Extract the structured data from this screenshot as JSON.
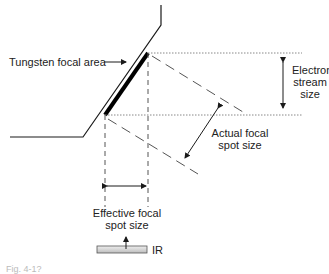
{
  "diagram": {
    "labels": {
      "tungsten_focal_area": "Tungsten focal area",
      "electron_stream_line1": "Electron",
      "electron_stream_line2": "stream",
      "electron_stream_line3": "size",
      "actual_focal_line1": "Actual focal",
      "actual_focal_line2": "spot size",
      "effective_focal_line1": "Effective focal",
      "effective_focal_line2": "spot size",
      "image_receptor": "IR"
    },
    "caption": "Fig. 4-1?",
    "colors": {
      "line": "#1a1a1a",
      "dotted": "#888888",
      "dashed": "#666666",
      "ir_bar": "#cfcfcf"
    }
  }
}
